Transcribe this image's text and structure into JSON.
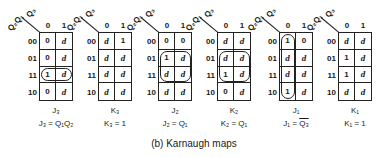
{
  "caption": "(b) Karnaugh maps",
  "axis": {
    "top_var": "Q₃",
    "left_var": "Q₂Q₁",
    "col_headers": [
      "0",
      "1"
    ],
    "row_headers": [
      "00",
      "01",
      "11",
      "10"
    ]
  },
  "maps": [
    {
      "name": "J₃",
      "equation": "J₃ = Q₁Q₂",
      "cells": [
        [
          "0",
          "d"
        ],
        [
          "0",
          "d"
        ],
        [
          "1",
          "d"
        ],
        [
          "0",
          "d"
        ]
      ],
      "loop": "row 11, both columns"
    },
    {
      "name": "K₃",
      "equation": "K₃ = 1",
      "cells": [
        [
          "d",
          "1"
        ],
        [
          "d",
          "d"
        ],
        [
          "d",
          "d"
        ],
        [
          "d",
          "d"
        ]
      ],
      "loop": "none"
    },
    {
      "name": "J₂",
      "equation": "J₂ = Q₁",
      "cells": [
        [
          "0",
          "0"
        ],
        [
          "1",
          "d"
        ],
        [
          "d",
          "d"
        ],
        [
          "d",
          "d"
        ]
      ],
      "loop": "rows 01-11, both columns"
    },
    {
      "name": "K₂",
      "equation": "K₂ = Q₁",
      "cells": [
        [
          "d",
          "d"
        ],
        [
          "d",
          "d"
        ],
        [
          "1",
          "d"
        ],
        [
          "0",
          "d"
        ]
      ],
      "loop": "rows 01-11, both columns"
    },
    {
      "name": "J₁",
      "equation_lhs": "J₁ = ",
      "equation_rhs": "Q₃",
      "cells": [
        [
          "1",
          "0"
        ],
        [
          "d",
          "d"
        ],
        [
          "d",
          "d"
        ],
        [
          "1",
          "d"
        ]
      ],
      "loop": "column 0, all rows"
    },
    {
      "name": "K₁",
      "equation": "K₁ = 1",
      "cells": [
        [
          "d",
          "d"
        ],
        [
          "1",
          "d"
        ],
        [
          "1",
          "d"
        ],
        [
          "d",
          "d"
        ]
      ],
      "loop": "none"
    }
  ]
}
